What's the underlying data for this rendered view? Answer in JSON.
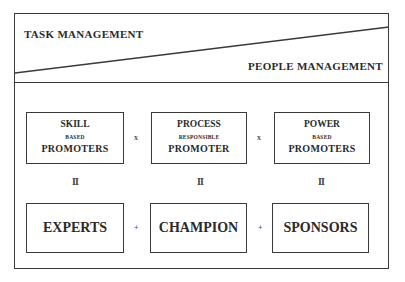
{
  "header": {
    "task_label": "TASK MANAGEMENT",
    "people_label": "PEOPLE MANAGEMENT"
  },
  "promoters": [
    {
      "line1": "SKILL",
      "line2": "BASED",
      "line3": "PROMOTERS"
    },
    {
      "line1": "PROCESS",
      "line2": "RESPONSIBLE",
      "line3": "PROMOTER"
    },
    {
      "line1": "POWER",
      "line2": "BASED",
      "line3": "PROMOTERS"
    }
  ],
  "top_operators": [
    "x",
    "x"
  ],
  "equals": [
    "II",
    "II",
    "II"
  ],
  "roles": [
    "EXPERTS",
    "CHAMPION",
    "SPONSORS"
  ],
  "bottom_operators": [
    "+",
    "+"
  ],
  "colors": {
    "line": "#3a3a3a",
    "text": "#2a2a2a",
    "background": "#ffffff"
  }
}
